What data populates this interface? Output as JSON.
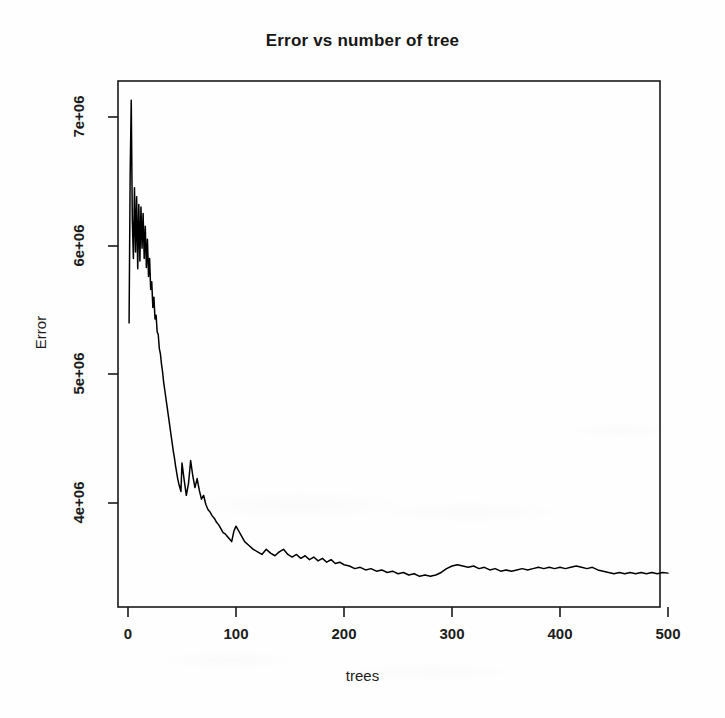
{
  "chart_data": {
    "type": "line",
    "title": "Error vs number of tree",
    "xlabel": "trees",
    "ylabel": "Error",
    "grid": false,
    "legend": null,
    "xlim": [
      1,
      500
    ],
    "ylim": [
      3350000,
      7200000
    ],
    "xticks": [
      0,
      100,
      200,
      300,
      400,
      500
    ],
    "xtick_labels": [
      "0",
      "100",
      "200",
      "300",
      "400",
      "500"
    ],
    "yticks": [
      4000000,
      5000000,
      6000000,
      7000000
    ],
    "ytick_labels": [
      "4e+06",
      "5e+06",
      "6e+06",
      "7e+06"
    ],
    "series": [
      {
        "name": "Error",
        "color": "#000000",
        "x": [
          1,
          2,
          3,
          4,
          5,
          6,
          7,
          8,
          9,
          10,
          11,
          12,
          13,
          14,
          15,
          16,
          17,
          18,
          19,
          20,
          21,
          22,
          23,
          24,
          25,
          26,
          27,
          28,
          29,
          30,
          31,
          32,
          33,
          34,
          35,
          36,
          37,
          38,
          39,
          40,
          41,
          42,
          43,
          44,
          45,
          46,
          47,
          48,
          49,
          50,
          52,
          54,
          56,
          58,
          60,
          62,
          64,
          66,
          68,
          70,
          72,
          74,
          76,
          78,
          80,
          82,
          84,
          86,
          88,
          90,
          92,
          94,
          96,
          98,
          100,
          104,
          108,
          112,
          116,
          120,
          124,
          128,
          132,
          136,
          140,
          144,
          148,
          152,
          156,
          160,
          164,
          168,
          172,
          176,
          180,
          184,
          188,
          192,
          196,
          200,
          205,
          210,
          215,
          220,
          225,
          230,
          235,
          240,
          245,
          250,
          255,
          260,
          265,
          270,
          275,
          280,
          285,
          290,
          295,
          300,
          305,
          310,
          315,
          320,
          325,
          330,
          335,
          340,
          345,
          350,
          355,
          360,
          365,
          370,
          375,
          380,
          385,
          390,
          395,
          400,
          405,
          410,
          415,
          420,
          425,
          430,
          435,
          440,
          445,
          450,
          455,
          460,
          465,
          470,
          475,
          480,
          485,
          490,
          495,
          500
        ],
        "y": [
          5400000,
          6550000,
          7130000,
          6200000,
          5900000,
          6450000,
          5950000,
          6380000,
          5820000,
          6320000,
          5880000,
          6300000,
          5980000,
          6250000,
          5900000,
          6150000,
          5830000,
          6050000,
          5760000,
          5900000,
          5660000,
          5720000,
          5520000,
          5600000,
          5430000,
          5460000,
          5330000,
          5310000,
          5200000,
          5160000,
          5080000,
          5020000,
          4940000,
          4880000,
          4820000,
          4760000,
          4700000,
          4640000,
          4580000,
          4520000,
          4460000,
          4400000,
          4350000,
          4290000,
          4240000,
          4190000,
          4150000,
          4120000,
          4090000,
          4310000,
          4180000,
          4060000,
          4150000,
          4330000,
          4210000,
          4120000,
          4190000,
          4100000,
          4030000,
          4060000,
          3990000,
          3950000,
          3930000,
          3900000,
          3880000,
          3850000,
          3830000,
          3800000,
          3770000,
          3760000,
          3740000,
          3720000,
          3700000,
          3780000,
          3820000,
          3760000,
          3700000,
          3670000,
          3640000,
          3620000,
          3600000,
          3640000,
          3610000,
          3590000,
          3620000,
          3640000,
          3600000,
          3580000,
          3600000,
          3570000,
          3590000,
          3560000,
          3580000,
          3550000,
          3570000,
          3540000,
          3560000,
          3530000,
          3540000,
          3520000,
          3510000,
          3490000,
          3500000,
          3480000,
          3490000,
          3470000,
          3480000,
          3460000,
          3470000,
          3450000,
          3460000,
          3440000,
          3450000,
          3430000,
          3440000,
          3430000,
          3440000,
          3460000,
          3490000,
          3510000,
          3520000,
          3510000,
          3500000,
          3510000,
          3490000,
          3500000,
          3480000,
          3490000,
          3470000,
          3480000,
          3470000,
          3480000,
          3490000,
          3480000,
          3490000,
          3500000,
          3490000,
          3500000,
          3490000,
          3500000,
          3490000,
          3500000,
          3510000,
          3500000,
          3490000,
          3500000,
          3480000,
          3470000,
          3460000,
          3450000,
          3460000,
          3450000,
          3460000,
          3450000,
          3460000,
          3450000,
          3460000,
          3450000,
          3460000,
          3455000
        ]
      }
    ]
  },
  "chart": {
    "title": "Error vs number of tree",
    "x_axis_title": "trees",
    "y_axis_title": "Error",
    "x_tick_labels": [
      "0",
      "100",
      "200",
      "300",
      "400",
      "500"
    ],
    "y_tick_labels": [
      "4e+06",
      "5e+06",
      "6e+06",
      "7e+06"
    ],
    "line_color": "#000000",
    "axis_color": "#1a1a1a",
    "background_color": "#ffffff"
  }
}
